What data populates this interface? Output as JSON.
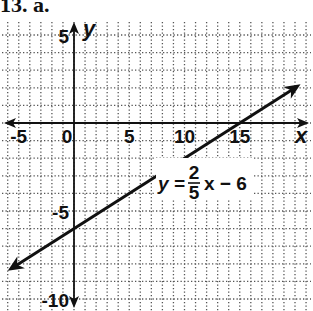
{
  "problem_label": "13. a.",
  "chart_data": {
    "type": "line",
    "title": "",
    "xlabel": "x",
    "ylabel": "y",
    "xlim": [
      -6,
      21
    ],
    "ylim": [
      -11,
      6
    ],
    "grid": true,
    "x_ticks": [
      -5,
      0,
      5,
      10,
      15
    ],
    "y_ticks": [
      5,
      -5,
      -10
    ],
    "x_tick_labels": [
      "-5",
      "0",
      "5",
      "10",
      "15"
    ],
    "y_tick_labels": [
      "5",
      "-5",
      "-10"
    ],
    "series": [
      {
        "name": "y = 2/5 x - 6",
        "equation": "y = (2/5)x - 6",
        "slope": 0.4,
        "intercept": -6,
        "x": [
          -6,
          0,
          15,
          20.5
        ],
        "y": [
          -8.4,
          -6,
          0,
          2.2
        ],
        "arrows": "both"
      }
    ],
    "annotations": [
      {
        "text": "y = 2/5 x - 6",
        "x": 10,
        "y": -3
      }
    ]
  },
  "equation_label": {
    "lhs": "y =",
    "num": "2",
    "den": "5",
    "rhs": "x − 6"
  }
}
